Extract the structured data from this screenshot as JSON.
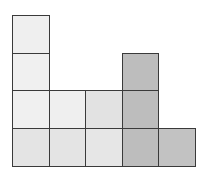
{
  "diagram": {
    "title": "",
    "origin": {
      "x": 12,
      "y": 166
    },
    "cell_size": {
      "w": 36.6,
      "h": 37.8
    },
    "border_color": "#3a3a3a",
    "columns": [
      {
        "index": 0,
        "height": 4,
        "colors": [
          "#e4e4e4",
          "#f0f0f0",
          "#f0f0f0",
          "#efefef"
        ]
      },
      {
        "index": 1,
        "height": 2,
        "colors": [
          "#e4e4e4",
          "#efefef"
        ]
      },
      {
        "index": 2,
        "height": 2,
        "colors": [
          "#e6e6e6",
          "#e2e2e2"
        ]
      },
      {
        "index": 3,
        "height": 3,
        "colors": [
          "#bdbdbd",
          "#bdbdbd",
          "#bdbdbd"
        ]
      },
      {
        "index": 4,
        "height": 1,
        "colors": [
          "#c2c2c2"
        ]
      }
    ]
  }
}
